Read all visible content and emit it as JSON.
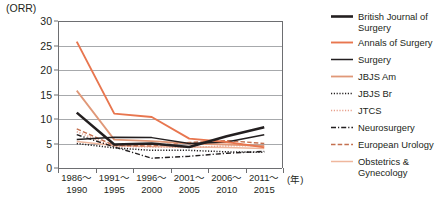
{
  "chart_data": {
    "type": "line",
    "title": "",
    "ylabel": "(ORR)",
    "xlabel": "(年)",
    "ylim": [
      0,
      30
    ],
    "yticks": [
      0,
      5,
      10,
      15,
      20,
      25,
      30
    ],
    "grid": true,
    "legend_position": "right",
    "categories": [
      {
        "line1": "1986～",
        "line2": "1990"
      },
      {
        "line1": "1991～",
        "line2": "1995"
      },
      {
        "line1": "1996～",
        "line2": "2000"
      },
      {
        "line1": "2001～",
        "line2": "2005"
      },
      {
        "line1": "2006～",
        "line2": "2010"
      },
      {
        "line1": "2011～",
        "line2": "2015"
      }
    ],
    "series": [
      {
        "name": "British Journal of Surgery",
        "label_line1": "British Journal of",
        "label_line2": "Surgery",
        "color": "#231f20",
        "width": 2.6,
        "dash": "none",
        "values": [
          11.3,
          4.8,
          5.0,
          4.3,
          6.5,
          8.3
        ]
      },
      {
        "name": "Annals of Surgery",
        "label_line1": "Annals of Surgery",
        "label_line2": "",
        "color": "#e8764f",
        "width": 1.9,
        "dash": "none",
        "values": [
          25.8,
          11.1,
          10.4,
          6.0,
          5.3,
          4.2
        ]
      },
      {
        "name": "Surgery",
        "label_line1": "Surgery",
        "label_line2": "",
        "color": "#231f20",
        "width": 1.5,
        "dash": "none",
        "values": [
          5.8,
          6.3,
          6.2,
          5.0,
          5.3,
          6.8
        ]
      },
      {
        "name": "JBJS Am",
        "label_line1": "JBJS Am",
        "label_line2": "",
        "color": "#e09878",
        "width": 1.8,
        "dash": "none",
        "values": [
          15.8,
          5.8,
          5.5,
          5.0,
          4.8,
          4.5
        ]
      },
      {
        "name": "JBJS Br",
        "label_line1": "JBJS Br",
        "label_line2": "",
        "color": "#231f20",
        "width": 1.5,
        "dash": "1.2,1.6",
        "values": [
          5.0,
          4.1,
          3.6,
          3.6,
          3.3,
          3.2
        ]
      },
      {
        "name": "JTCS",
        "label_line1": "JTCS",
        "label_line2": "",
        "color": "#e8a08c",
        "width": 1.4,
        "dash": "1.2,1.6",
        "values": [
          7.4,
          4.4,
          4.3,
          4.2,
          4.5,
          4.6
        ]
      },
      {
        "name": "Neurosurgery",
        "label_line1": "Neurosurgery",
        "label_line2": "",
        "color": "#231f20",
        "width": 1.4,
        "dash": "5,2,1.2,2",
        "values": [
          6.8,
          4.3,
          2.0,
          2.4,
          3.0,
          3.4
        ]
      },
      {
        "name": "European Urology",
        "label_line1": "European Urology",
        "label_line2": "",
        "color": "#c4704f",
        "width": 1.4,
        "dash": "4.5,2.2",
        "values": [
          8.0,
          4.6,
          4.5,
          5.2,
          5.6,
          5.0
        ]
      },
      {
        "name": "Obstetrics & Gynecology",
        "label_line1": "Obstetrics &",
        "label_line2": "Gynecology",
        "color": "#efb79d",
        "width": 1.5,
        "dash": "none",
        "values": [
          5.4,
          4.6,
          4.4,
          4.3,
          4.2,
          4.0
        ]
      }
    ]
  }
}
